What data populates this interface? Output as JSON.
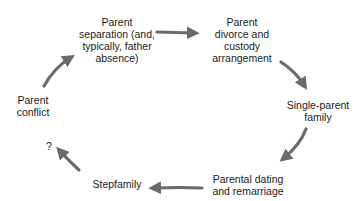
{
  "diagram": {
    "type": "cycle",
    "arrow_color": "#6b6b6b",
    "nodes": [
      {
        "id": "separation",
        "lines": [
          "Parent",
          "separation (and,",
          "typically, father",
          "absence)"
        ]
      },
      {
        "id": "divorce",
        "lines": [
          "Parent",
          "divorce and",
          "custody",
          "arrangement"
        ]
      },
      {
        "id": "single_parent",
        "lines": [
          "Single-parent",
          "family"
        ]
      },
      {
        "id": "dating",
        "lines": [
          "Parental dating",
          "and remarriage"
        ]
      },
      {
        "id": "stepfamily",
        "lines": [
          "Stepfamily"
        ]
      },
      {
        "id": "unknown",
        "lines": [
          "?"
        ]
      },
      {
        "id": "conflict",
        "lines": [
          "Parent",
          "conflict"
        ]
      }
    ],
    "edges": [
      {
        "from": "conflict",
        "to": "separation"
      },
      {
        "from": "separation",
        "to": "divorce"
      },
      {
        "from": "divorce",
        "to": "single_parent"
      },
      {
        "from": "single_parent",
        "to": "dating"
      },
      {
        "from": "dating",
        "to": "stepfamily"
      },
      {
        "from": "stepfamily",
        "to": "unknown"
      }
    ]
  }
}
